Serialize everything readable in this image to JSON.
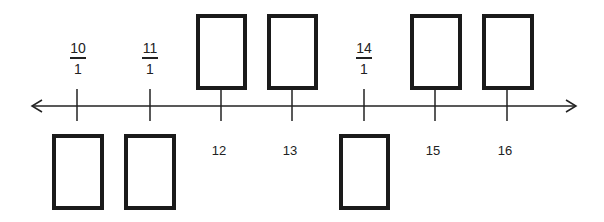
{
  "number_line": {
    "ticks": [
      {
        "value": 10,
        "label_type": "fraction",
        "numerator": "10",
        "denominator": "1",
        "label_position": "above",
        "blank_box": "below"
      },
      {
        "value": 11,
        "label_type": "fraction",
        "numerator": "11",
        "denominator": "1",
        "label_position": "above",
        "blank_box": "below"
      },
      {
        "value": 12,
        "label_type": "integer",
        "label": "12",
        "label_position": "below",
        "blank_box": "above"
      },
      {
        "value": 13,
        "label_type": "integer",
        "label": "13",
        "label_position": "below",
        "blank_box": "above"
      },
      {
        "value": 14,
        "label_type": "fraction",
        "numerator": "14",
        "denominator": "1",
        "label_position": "above",
        "blank_box": "below"
      },
      {
        "value": 15,
        "label_type": "integer",
        "label": "15",
        "label_position": "below",
        "blank_box": "above"
      },
      {
        "value": 16,
        "label_type": "integer",
        "label": "16",
        "label_position": "below",
        "blank_box": "above"
      }
    ],
    "arrows": "both",
    "line_color": "#222222",
    "box_color": "#1a1a1a"
  }
}
